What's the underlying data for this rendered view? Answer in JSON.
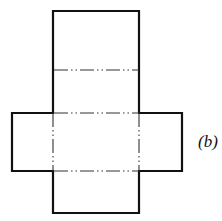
{
  "figure": {
    "label": "(b)",
    "colors": {
      "line": "#111111",
      "background": "#ffffff"
    }
  }
}
